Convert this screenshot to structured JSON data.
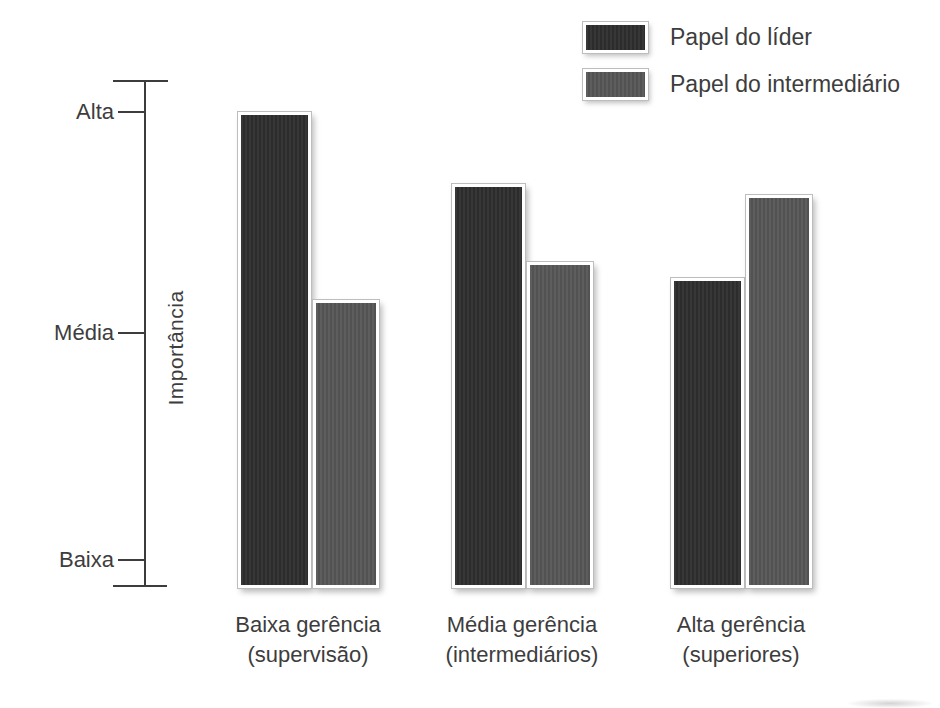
{
  "legend": {
    "items": [
      {
        "label": "Papel do líder",
        "color": "#2f2f2f"
      },
      {
        "label": "Papel do intermediário",
        "color": "#575757"
      }
    ]
  },
  "y_axis": {
    "label": "Importância",
    "ticks": [
      "Alta",
      "Média",
      "Baixa"
    ]
  },
  "x_axis": {
    "categories": [
      {
        "line1": "Baixa gerência",
        "line2": "(supervisão)"
      },
      {
        "line1": "Média gerência",
        "line2": "(intermediários)"
      },
      {
        "line1": "Alta gerência",
        "line2": "(superiores)"
      }
    ]
  },
  "chart_data": {
    "type": "bar",
    "title": "",
    "ylabel": "Importância",
    "xlabel": "",
    "categories": [
      "Baixa gerência (supervisão)",
      "Média gerência (intermediários)",
      "Alta gerência (superiores)"
    ],
    "y_tick_labels": [
      "Baixa",
      "Média",
      "Alta"
    ],
    "y_scale_note": "qualitative axis: Baixa=1, Média=2, Alta=3 (values estimated from bar heights)",
    "series": [
      {
        "name": "Papel do líder",
        "color": "#2f2f2f",
        "values": [
          3.0,
          2.68,
          2.26
        ]
      },
      {
        "name": "Papel do intermediário",
        "color": "#575757",
        "values": [
          2.16,
          2.33,
          2.63
        ]
      }
    ],
    "ylim": [
      0.88,
      3.13
    ],
    "grid": false,
    "legend_position": "top-right"
  }
}
